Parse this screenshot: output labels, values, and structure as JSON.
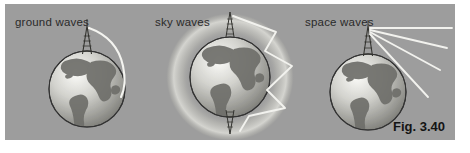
{
  "figure": {
    "caption": "Fig. 3.40",
    "panel_color": "#9d9d9d",
    "background_color": "#ffffff",
    "label_color": "#2a2a2a"
  },
  "panels": [
    {
      "id": "ground-waves",
      "label": "ground waves",
      "wave_type": "ground",
      "description": "curved arc following earth surface",
      "globe": {
        "cx": 82,
        "cy": 85,
        "r": 38
      },
      "antenna": {
        "x": 82,
        "top": 22,
        "bottom": 50
      },
      "ray_count": 1
    },
    {
      "id": "sky-waves",
      "label": "sky waves",
      "wave_type": "sky",
      "description": "zigzag rays reflecting between earth and ionosphere",
      "globe": {
        "cx": 85,
        "cy": 73,
        "r": 40
      },
      "ionosphere": {
        "cx": 85,
        "cy": 73,
        "r": 63
      },
      "antenna_top": {
        "x": 85,
        "top": 10,
        "bottom": 33
      },
      "antenna_bottom": {
        "x": 85,
        "top": 113,
        "bottom": 136
      },
      "reflection_points": 4
    },
    {
      "id": "space-waves",
      "label": "space waves",
      "wave_type": "space",
      "description": "straight rays radiating outward into space",
      "globe": {
        "cx": 68,
        "cy": 88,
        "r": 38
      },
      "antenna": {
        "x": 68,
        "top": 22,
        "bottom": 52
      },
      "ray_count": 4,
      "ray_angles_deg": [
        0,
        -12,
        -25,
        -40
      ]
    }
  ],
  "colors": {
    "ray": "#f2f2ef",
    "globe_ocean_light": "#f4f4f1",
    "globe_ocean_dark": "#8a8a8a",
    "globe_land": "#6f6f6f",
    "globe_outline": "#3a3a3a",
    "ionosphere_glow": "#c9c9c4"
  }
}
